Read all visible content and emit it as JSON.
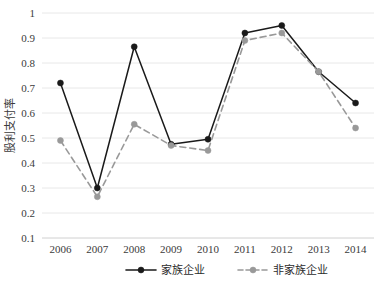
{
  "chart_data": {
    "type": "line",
    "title": "",
    "xlabel": "",
    "ylabel": "股利支付率",
    "categories": [
      "2006",
      "2007",
      "2008",
      "2009",
      "2010",
      "2011",
      "2012",
      "2013",
      "2014"
    ],
    "x": [
      2006,
      2007,
      2008,
      2009,
      2010,
      2011,
      2012,
      2013,
      2014
    ],
    "ylim": [
      0.1,
      1.0
    ],
    "yticks": [
      0.1,
      0.2,
      0.3,
      0.4,
      0.5,
      0.6,
      0.7,
      0.8,
      0.9,
      1.0
    ],
    "ytick_labels": [
      "0.1",
      "0.2",
      "0.3",
      "0.4",
      "0.5",
      "0.6",
      "0.7",
      "0.8",
      "0.9",
      "1"
    ],
    "grid": true,
    "legend_position": "bottom",
    "series": [
      {
        "name": "家族企业",
        "color": "#1a1a1a",
        "line_style": "solid",
        "marker": "circle",
        "values": [
          0.72,
          0.3,
          0.865,
          0.475,
          0.495,
          0.92,
          0.95,
          0.765,
          0.64
        ]
      },
      {
        "name": "非家族企业",
        "color": "#999999",
        "line_style": "dashed",
        "marker": "circle",
        "values": [
          0.49,
          0.265,
          0.555,
          0.47,
          0.45,
          0.89,
          0.92,
          0.765,
          0.54
        ]
      }
    ]
  },
  "colors": {
    "family": "#1a1a1a",
    "nonfamily": "#999999",
    "grid": "#e8e8e8",
    "text": "#3b3b3b",
    "background": "#ffffff"
  }
}
